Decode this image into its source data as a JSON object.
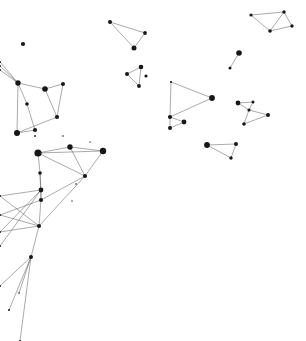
{
  "canvas": {
    "width": 306,
    "height": 341,
    "background_color": "#ffffff",
    "node_color": "#17171b",
    "edge_color": "#4a4a52",
    "edge_width": 0.55,
    "title": "Constellation Network Point Map"
  },
  "chart_data": {
    "type": "scatter",
    "xlabel": "",
    "ylabel": "",
    "xlim": [
      0,
      306
    ],
    "ylim": [
      0,
      341
    ],
    "grid": false,
    "legend": null,
    "annotations": [],
    "nodes": [
      {
        "id": 0,
        "x": 23,
        "y": 44,
        "r": 2.1
      },
      {
        "id": 1,
        "x": 0,
        "y": 62,
        "r": 1.0
      },
      {
        "id": 2,
        "x": 0,
        "y": 66,
        "r": 1.0
      },
      {
        "id": 3,
        "x": 0,
        "y": 70,
        "r": 1.0
      },
      {
        "id": 4,
        "x": 18,
        "y": 83,
        "r": 2.7
      },
      {
        "id": 5,
        "x": 45,
        "y": 89,
        "r": 2.8
      },
      {
        "id": 6,
        "x": 63,
        "y": 84,
        "r": 2.0
      },
      {
        "id": 7,
        "x": 27,
        "y": 104,
        "r": 1.8
      },
      {
        "id": 8,
        "x": 57,
        "y": 117,
        "r": 2.1
      },
      {
        "id": 9,
        "x": 17,
        "y": 133,
        "r": 3.0
      },
      {
        "id": 10,
        "x": 35,
        "y": 130,
        "r": 2.1
      },
      {
        "id": 11,
        "x": 35,
        "y": 136,
        "r": 0.9
      },
      {
        "id": 12,
        "x": 63,
        "y": 136,
        "r": 0.8
      },
      {
        "id": 13,
        "x": 110,
        "y": 22,
        "r": 2.0
      },
      {
        "id": 14,
        "x": 145,
        "y": 33,
        "r": 1.9
      },
      {
        "id": 15,
        "x": 134,
        "y": 48,
        "r": 2.5
      },
      {
        "id": 16,
        "x": 141,
        "y": 67,
        "r": 2.3
      },
      {
        "id": 17,
        "x": 127,
        "y": 74,
        "r": 2.0
      },
      {
        "id": 18,
        "x": 146,
        "y": 76,
        "r": 1.6
      },
      {
        "id": 19,
        "x": 139,
        "y": 86,
        "r": 1.9
      },
      {
        "id": 20,
        "x": 251,
        "y": 15,
        "r": 1.6
      },
      {
        "id": 21,
        "x": 284,
        "y": 12,
        "r": 1.7
      },
      {
        "id": 22,
        "x": 292,
        "y": 26,
        "r": 1.7
      },
      {
        "id": 23,
        "x": 270,
        "y": 31,
        "r": 1.8
      },
      {
        "id": 24,
        "x": 239,
        "y": 53,
        "r": 2.8
      },
      {
        "id": 25,
        "x": 230,
        "y": 68,
        "r": 1.5
      },
      {
        "id": 26,
        "x": 171,
        "y": 82,
        "r": 1.1
      },
      {
        "id": 27,
        "x": 212,
        "y": 98,
        "r": 2.9
      },
      {
        "id": 28,
        "x": 184,
        "y": 122,
        "r": 2.4
      },
      {
        "id": 29,
        "x": 170,
        "y": 117,
        "r": 2.1
      },
      {
        "id": 30,
        "x": 170,
        "y": 128,
        "r": 2.0
      },
      {
        "id": 31,
        "x": 238,
        "y": 103,
        "r": 2.4
      },
      {
        "id": 32,
        "x": 253,
        "y": 102,
        "r": 1.5
      },
      {
        "id": 33,
        "x": 249,
        "y": 110,
        "r": 1.6
      },
      {
        "id": 34,
        "x": 268,
        "y": 115,
        "r": 2.0
      },
      {
        "id": 35,
        "x": 244,
        "y": 124,
        "r": 1.8
      },
      {
        "id": 36,
        "x": 207,
        "y": 145,
        "r": 2.9
      },
      {
        "id": 37,
        "x": 236,
        "y": 144,
        "r": 2.0
      },
      {
        "id": 38,
        "x": 231,
        "y": 158,
        "r": 1.7
      },
      {
        "id": 39,
        "x": 103,
        "y": 151,
        "r": 3.2
      },
      {
        "id": 40,
        "x": 38,
        "y": 153,
        "r": 3.6
      },
      {
        "id": 41,
        "x": 70,
        "y": 147,
        "r": 2.7
      },
      {
        "id": 42,
        "x": 85,
        "y": 176,
        "r": 2.1
      },
      {
        "id": 43,
        "x": 76,
        "y": 184,
        "r": 0.8
      },
      {
        "id": 44,
        "x": 40,
        "y": 173,
        "r": 1.8
      },
      {
        "id": 45,
        "x": 41,
        "y": 190,
        "r": 2.4
      },
      {
        "id": 46,
        "x": 41,
        "y": 200,
        "r": 2.1
      },
      {
        "id": 47,
        "x": 39,
        "y": 226,
        "r": 2.0
      },
      {
        "id": 48,
        "x": 31,
        "y": 257,
        "r": 2.0
      },
      {
        "id": 49,
        "x": 0,
        "y": 196,
        "r": 1.0
      },
      {
        "id": 50,
        "x": 0,
        "y": 215,
        "r": 1.0
      },
      {
        "id": 51,
        "x": 0,
        "y": 232,
        "r": 1.0
      },
      {
        "id": 52,
        "x": 0,
        "y": 246,
        "r": 1.0
      },
      {
        "id": 53,
        "x": 9,
        "y": 310,
        "r": 1.0
      },
      {
        "id": 54,
        "x": 0,
        "y": 286,
        "r": 1.0
      },
      {
        "id": 55,
        "x": 19,
        "y": 293,
        "r": 0.8
      },
      {
        "id": 56,
        "x": 20,
        "y": 341,
        "r": 1.0
      },
      {
        "id": 57,
        "x": 72,
        "y": 201,
        "r": 0.7
      },
      {
        "id": 58,
        "x": 90,
        "y": 142,
        "r": 0.7
      }
    ],
    "edges": [
      [
        4,
        1
      ],
      [
        4,
        2
      ],
      [
        4,
        3
      ],
      [
        4,
        5
      ],
      [
        4,
        7
      ],
      [
        4,
        9
      ],
      [
        5,
        6
      ],
      [
        5,
        8
      ],
      [
        6,
        8
      ],
      [
        7,
        10
      ],
      [
        9,
        10
      ],
      [
        8,
        9
      ],
      [
        13,
        15
      ],
      [
        13,
        14
      ],
      [
        14,
        15
      ],
      [
        16,
        17
      ],
      [
        16,
        19
      ],
      [
        17,
        19
      ],
      [
        20,
        21
      ],
      [
        20,
        23
      ],
      [
        21,
        23
      ],
      [
        21,
        22
      ],
      [
        22,
        23
      ],
      [
        24,
        25
      ],
      [
        26,
        27
      ],
      [
        26,
        29
      ],
      [
        27,
        29
      ],
      [
        29,
        28
      ],
      [
        29,
        30
      ],
      [
        28,
        30
      ],
      [
        31,
        32
      ],
      [
        31,
        33
      ],
      [
        32,
        33
      ],
      [
        33,
        34
      ],
      [
        33,
        35
      ],
      [
        34,
        35
      ],
      [
        36,
        37
      ],
      [
        36,
        38
      ],
      [
        37,
        38
      ],
      [
        40,
        41
      ],
      [
        40,
        39
      ],
      [
        41,
        39
      ],
      [
        41,
        42
      ],
      [
        40,
        42
      ],
      [
        39,
        42
      ],
      [
        40,
        44
      ],
      [
        44,
        45
      ],
      [
        45,
        46
      ],
      [
        46,
        47
      ],
      [
        47,
        48
      ],
      [
        45,
        49
      ],
      [
        46,
        50
      ],
      [
        45,
        51
      ],
      [
        47,
        51
      ],
      [
        49,
        47
      ],
      [
        50,
        47
      ],
      [
        52,
        45
      ],
      [
        48,
        53
      ],
      [
        48,
        54
      ],
      [
        48,
        56
      ],
      [
        48,
        55
      ],
      [
        42,
        46
      ],
      [
        42,
        47
      ],
      [
        44,
        46
      ]
    ]
  }
}
